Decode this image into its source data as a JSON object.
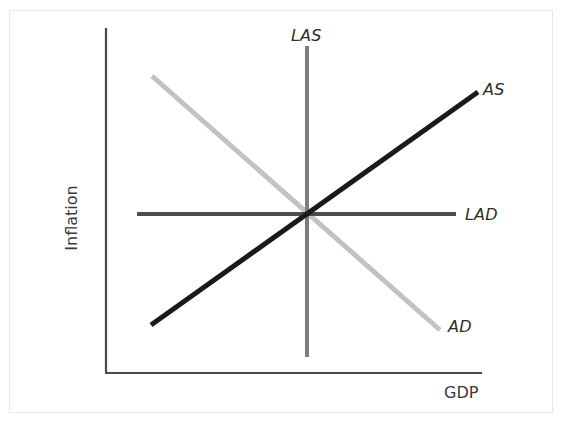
{
  "figure": {
    "background_color": "#ffffff",
    "frame_color": "#e9e9e9",
    "width": 569,
    "height": 424
  },
  "axes": {
    "y_axis_label": "Inflation",
    "x_axis_label": "GDP",
    "axis_color": "#4a4a4a",
    "origin": {
      "x": 106,
      "y": 373
    },
    "y_axis_top": {
      "x": 106,
      "y": 28
    },
    "x_axis_right": {
      "x": 482,
      "y": 373
    }
  },
  "chart_data": {
    "type": "line",
    "title": "",
    "xlabel": "GDP",
    "ylabel": "Inflation",
    "grid": false,
    "legend": "inline-end-labels",
    "xlim": [
      106,
      482
    ],
    "ylim": [
      373,
      28
    ],
    "equilibrium_point": {
      "x": 307,
      "y": 214
    },
    "series": [
      {
        "name": "LAS",
        "label": "LAS",
        "description": "Long-run aggregate supply, vertical line",
        "color": "#7d7d7d",
        "width": 4,
        "orientation": "vertical",
        "points": [
          {
            "x": 307,
            "y": 46
          },
          {
            "x": 307,
            "y": 357
          }
        ]
      },
      {
        "name": "LAD",
        "label": "LAD",
        "description": "Long-run aggregate demand, horizontal line",
        "color": "#4d4d4d",
        "width": 4,
        "orientation": "horizontal",
        "points": [
          {
            "x": 137,
            "y": 214
          },
          {
            "x": 456,
            "y": 214
          }
        ]
      },
      {
        "name": "AS",
        "label": "AS",
        "description": "Short-run aggregate supply, upward sloping",
        "color": "#1a1a1a",
        "width": 5,
        "orientation": "upward",
        "points": [
          {
            "x": 151,
            "y": 325
          },
          {
            "x": 478,
            "y": 92
          }
        ]
      },
      {
        "name": "AD",
        "label": "AD",
        "description": "Aggregate demand, downward sloping",
        "color": "#c2c2c2",
        "width": 5,
        "orientation": "downward",
        "points": [
          {
            "x": 152,
            "y": 76
          },
          {
            "x": 440,
            "y": 330
          }
        ]
      }
    ]
  },
  "labels": {
    "las": "LAS",
    "as": "AS",
    "lad": "LAD",
    "ad": "AD",
    "gdp": "GDP",
    "inflation": "Inflation"
  }
}
